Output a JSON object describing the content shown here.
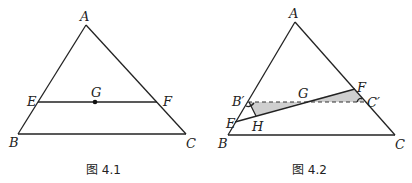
{
  "figures": [
    {
      "id": "fig-4-1",
      "caption": "图 4.1",
      "points": {
        "A": {
          "label": "A",
          "x": 86,
          "y": 25
        },
        "B": {
          "label": "B",
          "x": 18,
          "y": 134
        },
        "C": {
          "label": "C",
          "x": 186,
          "y": 134
        },
        "E": {
          "label": "E",
          "x": 38,
          "y": 102
        },
        "F": {
          "label": "F",
          "x": 157,
          "y": 102
        },
        "G": {
          "label": "G",
          "x": 95,
          "y": 102
        }
      },
      "segments": [
        [
          "A",
          "B"
        ],
        [
          "A",
          "C"
        ],
        [
          "B",
          "C"
        ],
        [
          "E",
          "F"
        ]
      ],
      "dots": [
        "G"
      ]
    },
    {
      "id": "fig-4-2",
      "caption": "图 4.2",
      "points": {
        "A": {
          "label": "A",
          "x": 295,
          "y": 22
        },
        "B": {
          "label": "B",
          "x": 228,
          "y": 135
        },
        "C": {
          "label": "C",
          "x": 395,
          "y": 135
        },
        "Bp": {
          "label": "B′",
          "x": 248,
          "y": 102
        },
        "Cp": {
          "label": "C′",
          "x": 364,
          "y": 102
        },
        "E": {
          "label": "E",
          "x": 235,
          "y": 122
        },
        "F": {
          "label": "F",
          "x": 355,
          "y": 89
        },
        "G": {
          "label": "G",
          "x": 303,
          "y": 102
        },
        "H": {
          "label": "H",
          "x": 255,
          "y": 116
        }
      },
      "segments": [
        [
          "A",
          "B"
        ],
        [
          "A",
          "C"
        ],
        [
          "B",
          "C"
        ],
        [
          "E",
          "F"
        ],
        [
          "Bp",
          "H"
        ]
      ],
      "dashed_segments": [
        [
          "Bp",
          "Cp"
        ]
      ],
      "shaded_regions": [
        [
          "Bp",
          "G",
          "H"
        ],
        [
          "G",
          "F",
          "Cp"
        ]
      ],
      "angle_marks": [
        "Bp",
        "Cp"
      ]
    }
  ]
}
